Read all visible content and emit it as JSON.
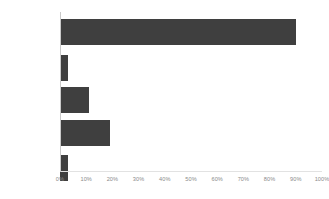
{
  "chart_data": {
    "type": "bar",
    "orientation": "horizontal",
    "title": "",
    "subtitle": "",
    "xlabel": "",
    "ylabel": "",
    "xlim": [
      0,
      100
    ],
    "grid": false,
    "legend": false,
    "legend_position": "none",
    "bar_color": "#3f3f3f",
    "axis_color": "#c9c9c9",
    "tick_label_color": "#8a8a8a",
    "category_label_color": "#4a4a4a",
    "categories": [
      "Research",
      "Survey",
      "Diagnostic",
      "Development",
      "Other (please\nspecify)"
    ],
    "values": [
      90,
      3,
      11,
      19,
      3
    ],
    "value_unit": "%",
    "xticks": [
      0,
      10,
      20,
      30,
      40,
      50,
      60,
      70,
      80,
      90,
      100
    ],
    "xtick_labels": [
      "0%",
      "10%",
      "20%",
      "30%",
      "40%",
      "50%",
      "60%",
      "70%",
      "80%",
      "90%",
      "100%"
    ]
  }
}
